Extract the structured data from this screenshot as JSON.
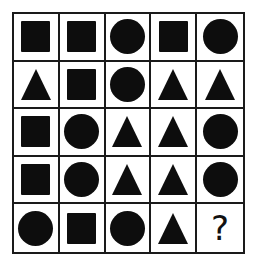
{
  "puzzle": {
    "rows": 5,
    "cols": 5,
    "cells": [
      [
        "square",
        "square",
        "circle",
        "square",
        "circle"
      ],
      [
        "triangle",
        "square",
        "circle",
        "triangle",
        "triangle"
      ],
      [
        "square",
        "circle",
        "triangle",
        "triangle",
        "circle"
      ],
      [
        "square",
        "circle",
        "triangle",
        "triangle",
        "circle"
      ],
      [
        "circle",
        "square",
        "circle",
        "triangle",
        "question"
      ]
    ],
    "question_mark": "?",
    "colors": {
      "shape_fill": "#0d0d0d",
      "grid_line": "#1a1a1a",
      "background": "#ffffff"
    }
  }
}
